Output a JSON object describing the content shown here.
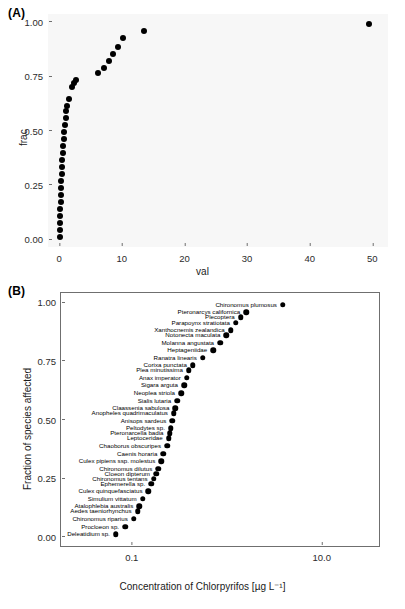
{
  "figure": {
    "background": "#ffffff",
    "dot_color": "#000000"
  },
  "panelA": {
    "tag": "(A)",
    "plot_background": "#f7f7f7",
    "chart_data": {
      "type": "scatter",
      "title": "",
      "xlabel": "val",
      "ylabel": "frac",
      "xlim": [
        -1.8,
        52.5
      ],
      "ylim": [
        -0.035,
        1.035
      ],
      "xticks": [
        0,
        10,
        20,
        30,
        40,
        50
      ],
      "xtick_labels": [
        "0",
        "10",
        "20",
        "30",
        "40",
        "50"
      ],
      "yticks": [
        0.0,
        0.25,
        0.5,
        0.75,
        1.0
      ],
      "ytick_labels": [
        "0.00",
        "0.25",
        "0.50",
        "0.75",
        "1.00"
      ],
      "grid": false,
      "legend": "none",
      "x": [
        0.06,
        0.08,
        0.12,
        0.15,
        0.18,
        0.2,
        0.24,
        0.28,
        0.32,
        0.36,
        0.42,
        0.48,
        0.55,
        0.62,
        0.7,
        0.8,
        0.9,
        1.0,
        1.15,
        1.3,
        1.6,
        2.0,
        2.3,
        2.6,
        6.2,
        7.1,
        8.0,
        8.6,
        9.4,
        10.2,
        13.5,
        49.5
      ],
      "y": [
        0.0108,
        0.043,
        0.0753,
        0.1075,
        0.1398,
        0.172,
        0.2043,
        0.2366,
        0.2688,
        0.3011,
        0.3333,
        0.3656,
        0.3978,
        0.4301,
        0.4624,
        0.4946,
        0.5269,
        0.5591,
        0.5914,
        0.6129,
        0.6452,
        0.6989,
        0.7204,
        0.7312,
        0.7634,
        0.7849,
        0.8172,
        0.8495,
        0.8817,
        0.9247,
        0.957,
        0.9892
      ]
    }
  },
  "panelB": {
    "tag": "(B)",
    "plot_background": "#ffffff",
    "chart_data": {
      "type": "scatter",
      "title": "",
      "xlabel": "Concentration of Chlorpyrifos [µg L⁻¹]",
      "ylabel": "Fraction of species affected",
      "xscale": "log",
      "xlim": [
        0.018,
        40.0
      ],
      "ylim": [
        -0.04,
        1.04
      ],
      "xticks": [
        0.1,
        10.0
      ],
      "xtick_labels": [
        "0.1",
        "10.0"
      ],
      "yticks": [
        0.0,
        0.25,
        0.5,
        0.75,
        1.0
      ],
      "ytick_labels": [
        "0.00",
        "0.25",
        "0.50",
        "0.75",
        "1.00"
      ],
      "grid": false,
      "legend": "none",
      "points": [
        {
          "label": "Deleatidium sp.",
          "x": 0.068,
          "y": 0.0108
        },
        {
          "label": "Procloeon sp.",
          "x": 0.085,
          "y": 0.043
        },
        {
          "label": "Chironomus riparius",
          "x": 0.105,
          "y": 0.0753
        },
        {
          "label": "Aedes taeniorhynchus",
          "x": 0.115,
          "y": 0.1075
        },
        {
          "label": "Atalophlebia australis",
          "x": 0.12,
          "y": 0.129
        },
        {
          "label": "Simulium vittatum",
          "x": 0.13,
          "y": 0.1613
        },
        {
          "label": "Culex quinquefasciatus",
          "x": 0.15,
          "y": 0.1935
        },
        {
          "label": "Ephemerella sp.",
          "x": 0.16,
          "y": 0.2258
        },
        {
          "label": "Chironomus tentans",
          "x": 0.17,
          "y": 0.2473
        },
        {
          "label": "Cloeon dipterum",
          "x": 0.18,
          "y": 0.2688
        },
        {
          "label": "Chironomus dilutus",
          "x": 0.19,
          "y": 0.2903
        },
        {
          "label": "Culex pipiens ssp. molestus",
          "x": 0.205,
          "y": 0.3226
        },
        {
          "label": "Caenis horaria",
          "x": 0.215,
          "y": 0.3548
        },
        {
          "label": "Chaoborus obscuripes",
          "x": 0.235,
          "y": 0.3871
        },
        {
          "label": "Leptoceridae",
          "x": 0.245,
          "y": 0.4194
        },
        {
          "label": "Pteronarcella badia",
          "x": 0.25,
          "y": 0.4409
        },
        {
          "label": "Peltodytes sp.",
          "x": 0.258,
          "y": 0.4624
        },
        {
          "label": "Anisops sardeus",
          "x": 0.268,
          "y": 0.4946
        },
        {
          "label": "Anopheles quadrimaculatus",
          "x": 0.278,
          "y": 0.5269
        },
        {
          "label": "Claassenia sabulosa",
          "x": 0.288,
          "y": 0.5484
        },
        {
          "label": "Sialis lutaria",
          "x": 0.3,
          "y": 0.5806
        },
        {
          "label": "Neoplea striola",
          "x": 0.33,
          "y": 0.6129
        },
        {
          "label": "Sigara arguta",
          "x": 0.355,
          "y": 0.6452
        },
        {
          "label": "Anax imperator",
          "x": 0.38,
          "y": 0.6774
        },
        {
          "label": "Plea minutissima",
          "x": 0.4,
          "y": 0.7097
        },
        {
          "label": "Corixa punctata",
          "x": 0.44,
          "y": 0.7312
        },
        {
          "label": "Ranatra linearis",
          "x": 0.56,
          "y": 0.7634
        },
        {
          "label": "Heptageniidae",
          "x": 0.72,
          "y": 0.7957
        },
        {
          "label": "Molanna angustata",
          "x": 0.85,
          "y": 0.828
        },
        {
          "label": "Notonecta maculata",
          "x": 0.99,
          "y": 0.8602
        },
        {
          "label": "Xanthocnemis zealandica",
          "x": 1.1,
          "y": 0.8817
        },
        {
          "label": "Parapoynx stratiotata",
          "x": 1.25,
          "y": 0.914
        },
        {
          "label": "Plecoptera",
          "x": 1.4,
          "y": 0.9355
        },
        {
          "label": "Pteronarcys californica",
          "x": 1.6,
          "y": 0.957
        },
        {
          "label": "Chironomus plumosus",
          "x": 3.9,
          "y": 0.9892
        }
      ]
    }
  }
}
